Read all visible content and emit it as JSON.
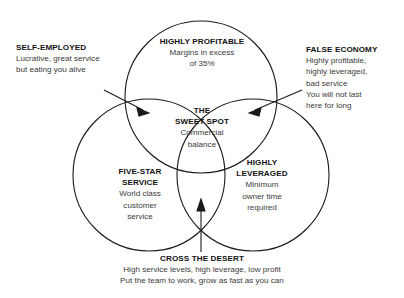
{
  "figure": {
    "type": "venn-diagram",
    "set_count": 3,
    "stroke_color": "#1a1a1a",
    "text_color": "#2b2b2b",
    "heading_color": "#111111",
    "background": "#ffffff"
  },
  "circles": [
    {
      "id": "highly-profitable",
      "position": "top",
      "heading": "HIGHLY PROFITABLE",
      "body_lines": [
        "Margins in excess",
        "of 35%"
      ]
    },
    {
      "id": "five-star-service",
      "position": "bottom-left",
      "heading_lines": [
        "FIVE-STAR",
        "SERVICE"
      ],
      "body_lines": [
        "World class",
        "customer",
        "service"
      ]
    },
    {
      "id": "highly-leveraged",
      "position": "bottom-right",
      "heading_lines": [
        "HIGHLY",
        "LEVERAGED"
      ],
      "body_lines": [
        "Minimum",
        "owner time",
        "required"
      ]
    }
  ],
  "center": {
    "id": "sweet-spot",
    "heading_lines": [
      "THE",
      "SWEET SPOT"
    ],
    "body_lines": [
      "Commercial",
      "balance"
    ]
  },
  "callouts": [
    {
      "id": "self-employed",
      "side": "left",
      "heading": "SELF-EMPLOYED",
      "body_lines": [
        "Lucrative, great service",
        "but eating you alive"
      ],
      "arrow": "points-right-into-profitable-service-overlap"
    },
    {
      "id": "false-economy",
      "side": "right",
      "heading": "FALSE ECONOMY",
      "body_lines": [
        "Highly profitable,",
        "highly leveraged,",
        "bad service",
        "You will not last",
        "here for long"
      ],
      "arrow": "points-left-into-profitable-leveraged-overlap"
    },
    {
      "id": "cross-the-desert",
      "side": "bottom",
      "heading": "CROSS THE DESERT",
      "body_lines": [
        "High service levels, high leverage, low profit",
        "Put the team to work, grow as fast as you can"
      ],
      "arrow": "points-up-into-service-leveraged-overlap"
    }
  ]
}
